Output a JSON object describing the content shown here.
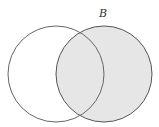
{
  "diagram": {
    "type": "venn",
    "sets": [
      {
        "name": "A",
        "label": "",
        "cx": 56,
        "cy": 74,
        "r": 48,
        "fill": "#ffffff",
        "stroke": "#666666",
        "shaded": false
      },
      {
        "name": "B",
        "label": "B",
        "cx": 104,
        "cy": 74,
        "r": 48,
        "fill": "#e6e6e6",
        "stroke": "#555555",
        "shaded": true
      }
    ],
    "label_B_position": {
      "x": 103,
      "y": 17
    },
    "shaded_region": "B"
  }
}
